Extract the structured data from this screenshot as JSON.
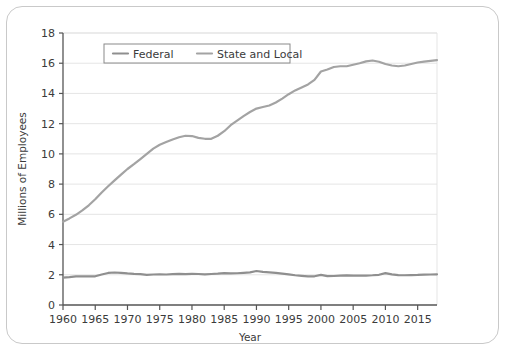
{
  "chart_data": {
    "type": "line",
    "title": "",
    "xlabel": "Year",
    "ylabel": "Millions of Employees",
    "xlim": [
      1960,
      2018
    ],
    "ylim": [
      0,
      18
    ],
    "xticks": [
      1960,
      1965,
      1970,
      1975,
      1980,
      1985,
      1990,
      1995,
      2000,
      2005,
      2010,
      2015
    ],
    "yticks": [
      0,
      2,
      4,
      6,
      8,
      10,
      12,
      14,
      16,
      18
    ],
    "grid": "horizontal",
    "legend_position": "top-center-inside",
    "x": [
      1960,
      1961,
      1962,
      1963,
      1964,
      1965,
      1966,
      1967,
      1968,
      1969,
      1970,
      1971,
      1972,
      1973,
      1974,
      1975,
      1976,
      1977,
      1978,
      1979,
      1980,
      1981,
      1982,
      1983,
      1984,
      1985,
      1986,
      1987,
      1988,
      1989,
      1990,
      1991,
      1992,
      1993,
      1994,
      1995,
      1996,
      1997,
      1998,
      1999,
      2000,
      2001,
      2002,
      2003,
      2004,
      2005,
      2006,
      2007,
      2008,
      2009,
      2010,
      2011,
      2012,
      2013,
      2014,
      2015,
      2016,
      2017,
      2018
    ],
    "series": [
      {
        "name": "Federal",
        "color": "#8f8f8f",
        "values": [
          1.81,
          1.84,
          1.89,
          1.9,
          1.9,
          1.9,
          2.02,
          2.12,
          2.15,
          2.13,
          2.09,
          2.06,
          2.04,
          2.0,
          2.02,
          2.03,
          2.02,
          2.04,
          2.06,
          2.04,
          2.06,
          2.05,
          2.03,
          2.05,
          2.07,
          2.11,
          2.09,
          2.1,
          2.13,
          2.16,
          2.25,
          2.19,
          2.16,
          2.13,
          2.08,
          2.03,
          1.97,
          1.93,
          1.89,
          1.9,
          1.99,
          1.91,
          1.92,
          1.94,
          1.96,
          1.95,
          1.95,
          1.95,
          1.97,
          2.0,
          2.11,
          2.03,
          1.98,
          1.97,
          1.98,
          1.99,
          2.01,
          2.02,
          2.03
        ]
      },
      {
        "name": "State and Local",
        "color": "#a3a3a3",
        "values": [
          5.51,
          5.73,
          5.97,
          6.26,
          6.6,
          7.0,
          7.45,
          7.86,
          8.25,
          8.63,
          9.0,
          9.32,
          9.66,
          10.0,
          10.35,
          10.6,
          10.78,
          10.95,
          11.1,
          11.2,
          11.18,
          11.06,
          11.0,
          11.0,
          11.2,
          11.5,
          11.9,
          12.2,
          12.5,
          12.77,
          13.0,
          13.1,
          13.2,
          13.4,
          13.66,
          13.95,
          14.2,
          14.4,
          14.6,
          14.9,
          15.45,
          15.58,
          15.75,
          15.8,
          15.8,
          15.9,
          16.0,
          16.12,
          16.18,
          16.1,
          15.95,
          15.85,
          15.8,
          15.85,
          15.95,
          16.05,
          16.1,
          16.15,
          16.2
        ]
      }
    ]
  }
}
